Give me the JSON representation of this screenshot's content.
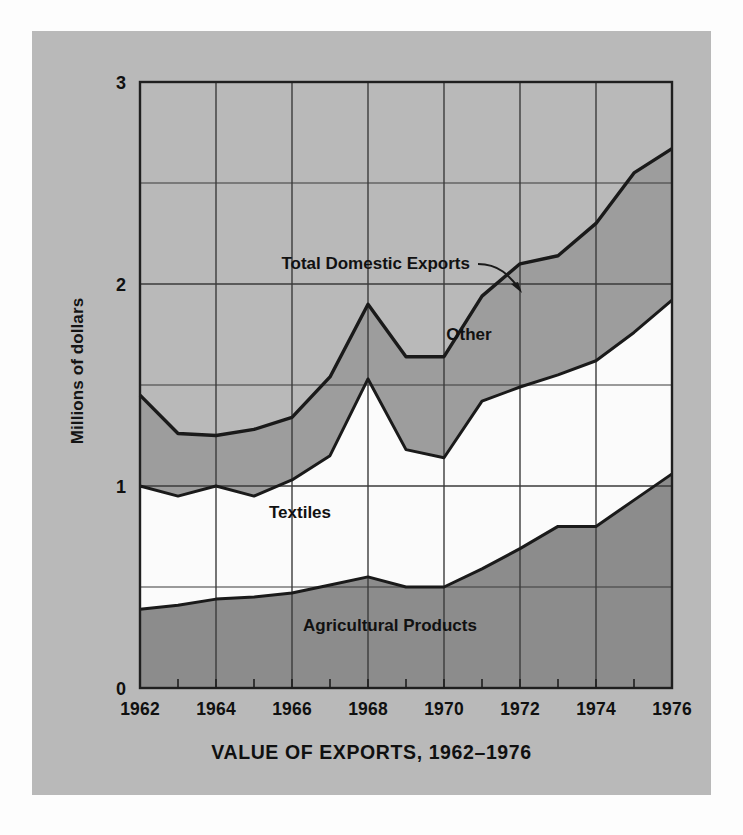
{
  "figure": {
    "background_color": "#fdfdfd",
    "panel_color": "#b9b9b9"
  },
  "axis": {
    "ylabel": "Millions of dollars",
    "yticks": [
      "0",
      "1",
      "2",
      "3"
    ],
    "xticks": [
      "1962",
      "1964",
      "1966",
      "1968",
      "1970",
      "1972",
      "1974",
      "1976"
    ]
  },
  "labels": {
    "title": "VALUE OF EXPORTS, 1962–1976",
    "total": "Total Domestic Exports",
    "other": "Other",
    "textiles": "Textiles",
    "agricultural": "Agricultural Products"
  },
  "colors": {
    "agricultural": "#8c8c8c",
    "textiles": "#fbfbfb",
    "other": "#9d9d9d",
    "background": "#b9b9b9",
    "line": "#1a1a1a",
    "grid": "#3b3b3b"
  },
  "chart_data": {
    "type": "area",
    "title": "VALUE OF EXPORTS, 1962–1976",
    "xlabel": "",
    "ylabel": "Millions of dollars",
    "xlim": [
      1962,
      1976
    ],
    "ylim": [
      0,
      3
    ],
    "grid": true,
    "stacked": true,
    "legend": "inline-annotations",
    "x": [
      1962,
      1963,
      1964,
      1965,
      1966,
      1967,
      1968,
      1969,
      1970,
      1971,
      1972,
      1973,
      1974,
      1975,
      1976
    ],
    "series": [
      {
        "name": "Agricultural Products",
        "color": "#8c8c8c",
        "values": [
          0.39,
          0.41,
          0.44,
          0.45,
          0.47,
          0.51,
          0.55,
          0.5,
          0.5,
          0.59,
          0.69,
          0.8,
          0.8,
          0.93,
          1.06
        ]
      },
      {
        "name": "Textiles",
        "color": "#fbfbfb",
        "values": [
          0.61,
          0.54,
          0.56,
          0.5,
          0.56,
          0.64,
          0.98,
          0.68,
          0.64,
          0.83,
          0.8,
          0.75,
          0.82,
          0.83,
          0.86
        ]
      },
      {
        "name": "Other",
        "color": "#9d9d9d",
        "values": [
          0.45,
          0.31,
          0.25,
          0.33,
          0.31,
          0.39,
          0.37,
          0.46,
          0.5,
          0.52,
          0.61,
          0.59,
          0.68,
          0.79,
          0.75
        ]
      }
    ],
    "cumulative": {
      "agricultural_top": [
        0.39,
        0.41,
        0.44,
        0.45,
        0.47,
        0.51,
        0.55,
        0.5,
        0.5,
        0.59,
        0.69,
        0.8,
        0.8,
        0.93,
        1.06
      ],
      "textiles_top": [
        1.0,
        0.95,
        1.0,
        0.95,
        1.03,
        1.15,
        1.53,
        1.18,
        1.14,
        1.42,
        1.49,
        1.55,
        1.62,
        1.76,
        1.92
      ],
      "total_top": [
        1.45,
        1.26,
        1.25,
        1.28,
        1.34,
        1.54,
        1.9,
        1.64,
        1.64,
        1.94,
        2.1,
        2.14,
        2.3,
        2.55,
        2.67
      ]
    }
  }
}
